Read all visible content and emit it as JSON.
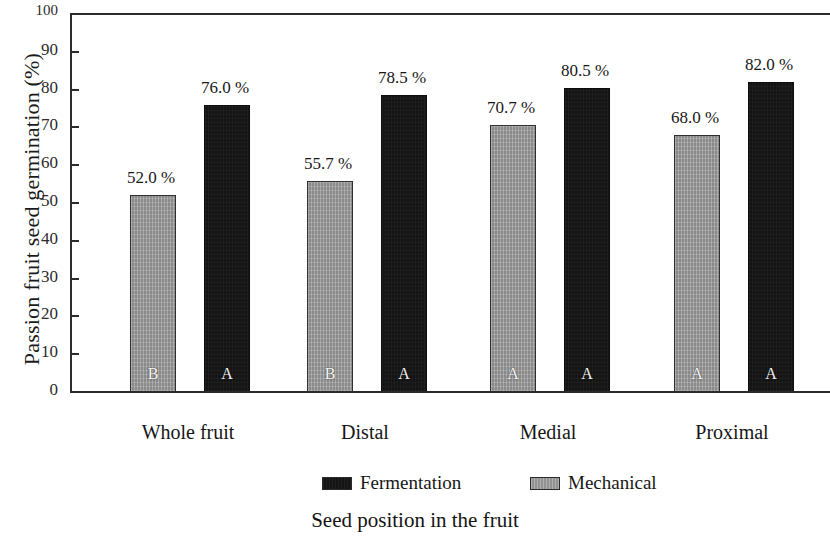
{
  "chart_data": {
    "type": "bar",
    "title": "",
    "subtitle": "",
    "xlabel": "Seed position in the fruit",
    "ylabel": "Passion fruit seed germination (%)",
    "categories": [
      "Whole fruit",
      "Distal",
      "Medial",
      "Proximal"
    ],
    "series": [
      {
        "name": "Mechanical",
        "color": "#9d9d9d",
        "values": [
          52.0,
          55.7,
          70.7,
          68.0
        ],
        "value_labels": [
          "52.0 %",
          "55.7 %",
          "70.7 %",
          "68.0 %"
        ],
        "group_letters": [
          "B",
          "B",
          "A",
          "A"
        ]
      },
      {
        "name": "Fermentation",
        "color": "#141414",
        "values": [
          76.0,
          78.5,
          80.5,
          82.0
        ],
        "value_labels": [
          "76.0 %",
          "78.5 %",
          "80.5 %",
          "82.0 %"
        ],
        "group_letters": [
          "A",
          "A",
          "A",
          "A"
        ]
      }
    ],
    "ylim": [
      0,
      100
    ],
    "yticks": [
      0,
      10,
      20,
      30,
      40,
      50,
      60,
      70,
      80,
      90,
      100
    ],
    "ytick_labels": [
      "0",
      "10",
      "20",
      "30",
      "40",
      "50",
      "60",
      "70",
      "80",
      "90",
      "100"
    ],
    "grid": false,
    "legend_position": "bottom",
    "legend_order": [
      "Fermentation",
      "Mechanical"
    ]
  },
  "axes": {
    "y_title": "Passion fruit seed germination (%)",
    "x_title": "Seed position in the fruit"
  },
  "ticks": {
    "y": [
      {
        "value": 100,
        "label": "100"
      },
      {
        "value": 90,
        "label": "90"
      },
      {
        "value": 80,
        "label": "80"
      },
      {
        "value": 70,
        "label": "70"
      },
      {
        "value": 60,
        "label": "60"
      },
      {
        "value": 50,
        "label": "50"
      },
      {
        "value": 40,
        "label": "40"
      },
      {
        "value": 30,
        "label": "30"
      },
      {
        "value": 20,
        "label": "20"
      },
      {
        "value": 10,
        "label": "10"
      },
      {
        "value": 0,
        "label": "0"
      }
    ]
  },
  "categories": [
    {
      "label": "Whole fruit"
    },
    {
      "label": "Distal"
    },
    {
      "label": "Medial"
    },
    {
      "label": "Proximal"
    }
  ],
  "bars": [
    {
      "group": "Whole fruit",
      "series": "Mechanical",
      "value": 52.0,
      "value_label": "52.0 %",
      "letter": "B"
    },
    {
      "group": "Whole fruit",
      "series": "Fermentation",
      "value": 76.0,
      "value_label": "76.0 %",
      "letter": "A"
    },
    {
      "group": "Distal",
      "series": "Mechanical",
      "value": 55.7,
      "value_label": "55.7 %",
      "letter": "B"
    },
    {
      "group": "Distal",
      "series": "Fermentation",
      "value": 78.5,
      "value_label": "78.5 %",
      "letter": "A"
    },
    {
      "group": "Medial",
      "series": "Mechanical",
      "value": 70.7,
      "value_label": "70.7 %",
      "letter": "A"
    },
    {
      "group": "Medial",
      "series": "Fermentation",
      "value": 80.5,
      "value_label": "80.5 %",
      "letter": "A"
    },
    {
      "group": "Proximal",
      "series": "Mechanical",
      "value": 68.0,
      "value_label": "68.0 %",
      "letter": "A"
    },
    {
      "group": "Proximal",
      "series": "Fermentation",
      "value": 82.0,
      "value_label": "82.0 %",
      "letter": "A"
    }
  ],
  "legend": {
    "items": [
      {
        "label": "Fermentation",
        "color": "#141414",
        "key": "fermentation"
      },
      {
        "label": "Mechanical",
        "color": "#9d9d9d",
        "key": "mechanical"
      }
    ]
  }
}
